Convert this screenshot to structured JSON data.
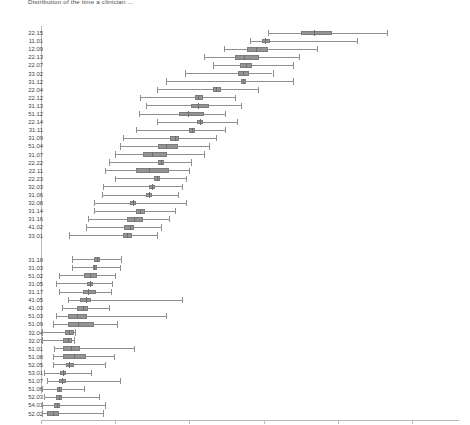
{
  "title": "Distribution of the time a clinician ...",
  "chart_data": {
    "type": "boxplot",
    "title": "Distribution of the time a clinician ...",
    "xlabel": "",
    "ylabel": "",
    "xlim": [
      0,
      28.1
    ],
    "xticks": [
      0,
      5,
      10,
      15,
      20,
      25
    ],
    "xticklabels": [
      "0",
      "5",
      "10",
      "15",
      "20",
      "25"
    ],
    "grid": false,
    "legend": null,
    "orientation": "horizontal",
    "box_color": "#939393",
    "line_color": "#8f8f8f",
    "groups": [
      {
        "name": "upper-group",
        "boxes": [
          {
            "label": "22.15",
            "whisker_low": 15.3,
            "q1": 17.5,
            "median": 18.4,
            "q3": 19.6,
            "whisker_high": 23.3
          },
          {
            "label": "11.01",
            "whisker_low": 14.1,
            "q1": 14.9,
            "median": 15.1,
            "q3": 15.4,
            "whisker_high": 21.3
          },
          {
            "label": "12.09",
            "whisker_low": 12.3,
            "q1": 13.9,
            "median": 14.5,
            "q3": 15.3,
            "whisker_high": 18.6
          },
          {
            "label": "22.13",
            "whisker_low": 11.0,
            "q1": 13.1,
            "median": 13.7,
            "q3": 14.7,
            "whisker_high": 17.4
          },
          {
            "label": "22.07",
            "whisker_low": 11.6,
            "q1": 13.4,
            "median": 13.8,
            "q3": 14.2,
            "whisker_high": 17.0
          },
          {
            "label": "33.02",
            "whisker_low": 9.7,
            "q1": 13.3,
            "median": 13.6,
            "q3": 14.0,
            "whisker_high": 15.6
          },
          {
            "label": "31.12",
            "whisker_low": 8.4,
            "q1": 13.5,
            "median": 13.6,
            "q3": 13.8,
            "whisker_high": 17.0
          },
          {
            "label": "22.04",
            "whisker_low": 7.8,
            "q1": 11.6,
            "median": 11.8,
            "q3": 12.1,
            "whisker_high": 14.6
          },
          {
            "label": "22.12",
            "whisker_low": 6.7,
            "q1": 10.4,
            "median": 10.6,
            "q3": 10.9,
            "whisker_high": 13.1
          },
          {
            "label": "31.13",
            "whisker_low": 7.1,
            "q1": 10.1,
            "median": 10.6,
            "q3": 11.3,
            "whisker_high": 13.5
          },
          {
            "label": "51.12",
            "whisker_low": 6.6,
            "q1": 9.3,
            "median": 9.9,
            "q3": 11.0,
            "whisker_high": 12.4
          },
          {
            "label": "22.14",
            "whisker_low": 7.8,
            "q1": 10.5,
            "median": 10.7,
            "q3": 10.9,
            "whisker_high": 13.2
          },
          {
            "label": "31.11",
            "whisker_low": 6.4,
            "q1": 10.0,
            "median": 10.2,
            "q3": 10.4,
            "whisker_high": 12.4
          },
          {
            "label": "31.09",
            "whisker_low": 5.5,
            "q1": 8.7,
            "median": 9.0,
            "q3": 9.3,
            "whisker_high": 11.8
          },
          {
            "label": "51.04",
            "whisker_low": 5.3,
            "q1": 7.9,
            "median": 8.4,
            "q3": 9.2,
            "whisker_high": 11.3
          },
          {
            "label": "31.07",
            "whisker_low": 5.0,
            "q1": 6.9,
            "median": 7.5,
            "q3": 8.5,
            "whisker_high": 11.0
          },
          {
            "label": "22.22",
            "whisker_low": 4.6,
            "q1": 7.9,
            "median": 8.1,
            "q3": 8.3,
            "whisker_high": 10.1
          },
          {
            "label": "22.11",
            "whisker_low": 4.3,
            "q1": 6.4,
            "median": 7.3,
            "q3": 8.6,
            "whisker_high": 10.0
          },
          {
            "label": "22.23",
            "whisker_low": 5.0,
            "q1": 7.6,
            "median": 7.8,
            "q3": 8.0,
            "whisker_high": 9.8
          },
          {
            "label": "32.03",
            "whisker_low": 4.2,
            "q1": 7.3,
            "median": 7.5,
            "q3": 7.7,
            "whisker_high": 9.5
          },
          {
            "label": "31.06",
            "whisker_low": 4.1,
            "q1": 7.1,
            "median": 7.3,
            "q3": 7.5,
            "whisker_high": 9.2
          },
          {
            "label": "32.08",
            "whisker_low": 3.6,
            "q1": 6.0,
            "median": 6.2,
            "q3": 6.4,
            "whisker_high": 9.8
          },
          {
            "label": "31.14",
            "whisker_low": 3.6,
            "q1": 6.4,
            "median": 6.7,
            "q3": 7.0,
            "whisker_high": 9.0
          },
          {
            "label": "31.16",
            "whisker_low": 3.2,
            "q1": 5.8,
            "median": 6.3,
            "q3": 6.9,
            "whisker_high": 8.6
          },
          {
            "label": "41.02",
            "whisker_low": 3.0,
            "q1": 5.6,
            "median": 6.0,
            "q3": 6.3,
            "whisker_high": 8.1
          },
          {
            "label": "33.01",
            "whisker_low": 1.9,
            "q1": 5.5,
            "median": 5.8,
            "q3": 6.1,
            "whisker_high": 7.8
          }
        ]
      },
      {
        "name": "lower-group",
        "boxes": [
          {
            "label": "31.18",
            "whisker_low": 2.1,
            "q1": 3.6,
            "median": 3.8,
            "q3": 4.0,
            "whisker_high": 5.4
          },
          {
            "label": "31.03",
            "whisker_low": 2.1,
            "q1": 3.5,
            "median": 3.6,
            "q3": 3.8,
            "whisker_high": 5.3
          },
          {
            "label": "51.02",
            "whisker_low": 1.2,
            "q1": 2.9,
            "median": 3.3,
            "q3": 3.8,
            "whisker_high": 5.0
          },
          {
            "label": "31.05",
            "whisker_low": 1.0,
            "q1": 3.1,
            "median": 3.3,
            "q3": 3.5,
            "whisker_high": 4.8
          },
          {
            "label": "31.17",
            "whisker_low": 1.2,
            "q1": 2.8,
            "median": 3.2,
            "q3": 3.7,
            "whisker_high": 4.7
          },
          {
            "label": "41.05",
            "whisker_low": 1.8,
            "q1": 2.6,
            "median": 3.0,
            "q3": 3.4,
            "whisker_high": 9.5
          },
          {
            "label": "41.03",
            "whisker_low": 1.4,
            "q1": 2.4,
            "median": 2.8,
            "q3": 3.2,
            "whisker_high": 4.6
          },
          {
            "label": "51.03",
            "whisker_low": 1.0,
            "q1": 1.8,
            "median": 2.4,
            "q3": 3.1,
            "whisker_high": 8.4
          },
          {
            "label": "51.09",
            "whisker_low": 0.8,
            "q1": 1.8,
            "median": 2.5,
            "q3": 3.6,
            "whisker_high": 5.1
          },
          {
            "label": "32.04",
            "whisker_low": 0.1,
            "q1": 1.6,
            "median": 1.9,
            "q3": 2.2,
            "whisker_high": 2.3
          },
          {
            "label": "32.07",
            "whisker_low": 0.1,
            "q1": 1.5,
            "median": 1.8,
            "q3": 2.1,
            "whisker_high": 2.2
          },
          {
            "label": "51.01",
            "whisker_low": 0.9,
            "q1": 1.5,
            "median": 2.0,
            "q3": 2.6,
            "whisker_high": 6.3
          },
          {
            "label": "51.08",
            "whisker_low": 0.8,
            "q1": 1.5,
            "median": 2.2,
            "q3": 3.0,
            "whisker_high": 4.9
          },
          {
            "label": "52.05",
            "whisker_low": 0.8,
            "q1": 1.7,
            "median": 1.9,
            "q3": 2.2,
            "whisker_high": 4.3
          },
          {
            "label": "53.01",
            "whisker_low": 0.2,
            "q1": 1.3,
            "median": 1.5,
            "q3": 1.7,
            "whisker_high": 3.4
          },
          {
            "label": "51.07",
            "whisker_low": 0.4,
            "q1": 1.2,
            "median": 1.4,
            "q3": 1.7,
            "whisker_high": 5.3
          },
          {
            "label": "51.06",
            "whisker_low": 0.1,
            "q1": 1.1,
            "median": 1.2,
            "q3": 1.4,
            "whisker_high": 2.9
          },
          {
            "label": "52.03",
            "whisker_low": 0.2,
            "q1": 1.0,
            "median": 1.2,
            "q3": 1.4,
            "whisker_high": 3.9
          },
          {
            "label": "54.01",
            "whisker_low": 0.1,
            "q1": 0.9,
            "median": 1.1,
            "q3": 1.3,
            "whisker_high": 4.3
          },
          {
            "label": "52.02",
            "whisker_low": 0.1,
            "q1": 0.4,
            "median": 0.8,
            "q3": 1.2,
            "whisker_high": 4.2
          }
        ]
      }
    ]
  }
}
